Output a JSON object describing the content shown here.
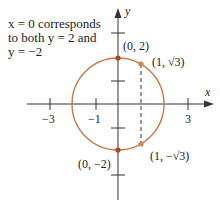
{
  "annotation": {
    "line1": "x = 0 corresponds",
    "line2": "to both y = 2 and",
    "line3": "y = −2"
  },
  "axes": {
    "x_label": "x",
    "y_label": "y",
    "x_ticks": [
      {
        "value": -3,
        "label": "−3"
      },
      {
        "value": -1,
        "label": "−1"
      },
      {
        "value": 1,
        "label": ""
      },
      {
        "value": 3,
        "label": "3"
      }
    ],
    "y_ticks": [
      {
        "value": -3,
        "label": ""
      },
      {
        "value": 3,
        "label": ""
      }
    ]
  },
  "circle": {
    "equation": "x^2 + y^2 = 4",
    "center": [
      0,
      0
    ],
    "radius": 2,
    "color": "#C8784A"
  },
  "points": [
    {
      "id": "p-0-2",
      "coords": [
        0,
        2
      ],
      "label": "(0, 2)"
    },
    {
      "id": "p-1-sqrt3",
      "coords": [
        1,
        1.732
      ],
      "label": "(1, √3)"
    },
    {
      "id": "p-0-neg2",
      "coords": [
        0,
        -2
      ],
      "label": "(0, −2)"
    },
    {
      "id": "p-1-negsqrt3",
      "coords": [
        1,
        -1.732
      ],
      "label": "(1, −√3)"
    }
  ],
  "dashed_line": {
    "x": 1,
    "from_y": 1.732,
    "to_y": -1.732
  },
  "colors": {
    "axis": "#333333",
    "curve": "#C8784A",
    "point": "#B0502E"
  }
}
